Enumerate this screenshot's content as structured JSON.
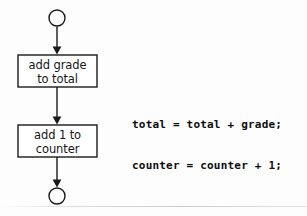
{
  "diagram": {
    "background_color": "#fdfdfd",
    "stroke_color": "#1a1a1a",
    "text_color": "#161616",
    "nodes": [
      {
        "id": "start",
        "type": "terminator-circle",
        "label": "",
        "fill": "none",
        "cx": 57,
        "cy": 18,
        "r": 8
      },
      {
        "id": "add-grade-to-total",
        "type": "process-box",
        "label": "add grade\nto total",
        "x": 18,
        "y": 55,
        "width": 79,
        "height": 32
      },
      {
        "id": "add-1-to-counter",
        "type": "process-box",
        "label": "add 1 to\ncounter",
        "x": 18,
        "y": 125,
        "width": 79,
        "height": 32
      },
      {
        "id": "end",
        "type": "terminator-circle",
        "label": "",
        "fill": "none",
        "cx": 57,
        "cy": 196,
        "r": 8
      }
    ],
    "connectors": [
      {
        "id": "start-to-box1",
        "from": "start",
        "to": "add-grade-to-total",
        "arrowhead": "filled-triangle"
      },
      {
        "id": "box1-to-box2",
        "from": "add-grade-to-total",
        "to": "add-1-to-counter",
        "arrowhead": "filled-triangle"
      },
      {
        "id": "box2-to-end",
        "from": "add-1-to-counter",
        "to": "end",
        "arrowhead": "filled-triangle"
      }
    ]
  },
  "annotation": {
    "name": "code-translation",
    "lines": [
      "total = total + grade;",
      "counter = counter + 1;"
    ],
    "line1": "total = total + grade;",
    "line2": "counter = counter + 1;"
  }
}
